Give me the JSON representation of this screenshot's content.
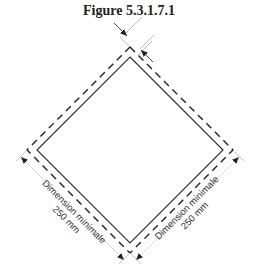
{
  "figure": {
    "title": "Figure 5.3.1.7.1",
    "left_label": {
      "line1": "Dimension minimale",
      "line2": "250 mm"
    },
    "right_label": {
      "line1": "Dimension minimale",
      "line2": "250 mm"
    }
  }
}
